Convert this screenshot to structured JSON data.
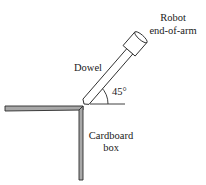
{
  "diagram": {
    "labels": {
      "robot_line1": "Robot",
      "robot_line2": "end-of-arm",
      "dowel": "Dowel",
      "angle": "45°",
      "box_line1": "Cardboard",
      "box_line2": "box"
    },
    "colors": {
      "wall_fill": "#a8a8a8",
      "outline": "#2a2a2a",
      "background": "#ffffff"
    }
  }
}
